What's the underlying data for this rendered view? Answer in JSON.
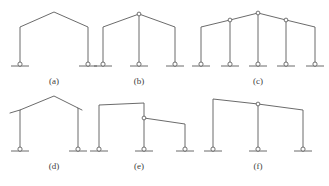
{
  "figure": {
    "background_color": "#ffffff",
    "line_color": "#5a5a5a",
    "caption_color": "#3d3d3d",
    "width": 329,
    "height": 186,
    "panels": [
      {
        "id": "a",
        "caption": "(a)",
        "caption_x": 54,
        "caption_y": 84,
        "description": "single-bay pitched portal frame, two pinned supports, no internal hinge",
        "column_count": 2,
        "hinge_count": 0,
        "support_count": 2,
        "members": "M20,66 L20,27 L54,12 L88,27 L88,66",
        "supports": [
          {
            "x": 20,
            "y": 66
          },
          {
            "x": 88,
            "y": 66
          }
        ],
        "hinges": []
      },
      {
        "id": "b",
        "caption": "(b)",
        "caption_x": 139,
        "caption_y": 84,
        "description": "single-bay pitched frame with central column and apex hinge",
        "column_count": 3,
        "hinge_count": 1,
        "support_count": 3,
        "members": "M103,66 L103,27 L139,14 L175,27 L175,66 M139,14 L139,66",
        "supports": [
          {
            "x": 103,
            "y": 66
          },
          {
            "x": 139,
            "y": 66
          },
          {
            "x": 175,
            "y": 66
          }
        ],
        "hinges": [
          {
            "x": 139,
            "y": 14
          }
        ]
      },
      {
        "id": "c",
        "caption": "(c)",
        "caption_x": 258,
        "caption_y": 84,
        "description": "multi-bay pitched frame, five columns, hinges at apex and two intermediate column heads",
        "column_count": 5,
        "hinge_count": 3,
        "support_count": 5,
        "members": "M201,66 L201,27 L230,20 L258,13 L286,20 L315,27 L315,66 M230,20 L230,66 M258,13 L258,66 M286,20 L286,66",
        "supports": [
          {
            "x": 201,
            "y": 66
          },
          {
            "x": 230,
            "y": 66
          },
          {
            "x": 258,
            "y": 66
          },
          {
            "x": 286,
            "y": 66
          },
          {
            "x": 315,
            "y": 66
          }
        ],
        "hinges": [
          {
            "x": 230,
            "y": 20
          },
          {
            "x": 258,
            "y": 13
          },
          {
            "x": 286,
            "y": 20
          }
        ]
      },
      {
        "id": "d",
        "caption": "(d)",
        "caption_x": 54,
        "caption_y": 169,
        "description": "pitched portal frame with cantilever roof overhangs beyond both columns",
        "column_count": 2,
        "hinge_count": 0,
        "support_count": 2,
        "members": "M20,151 L20,110 L54,96 L78,108 L78,151 M20,110 L10,113 M78,108 L82,110",
        "supports": [
          {
            "x": 20,
            "y": 151
          },
          {
            "x": 78,
            "y": 151
          }
        ],
        "hinges": []
      },
      {
        "id": "e",
        "caption": "(e)",
        "caption_x": 139,
        "caption_y": 169,
        "description": "stepped two-level frame with hinge at the step junction",
        "column_count": 3,
        "hinge_count": 1,
        "support_count": 3,
        "members": "M99,151 L99,105 L144,103 L144,151 M144,118 L185,124 L185,151",
        "supports": [
          {
            "x": 99,
            "y": 151
          },
          {
            "x": 144,
            "y": 151
          },
          {
            "x": 185,
            "y": 151
          }
        ],
        "hinges": [
          {
            "x": 144,
            "y": 118
          }
        ]
      },
      {
        "id": "f",
        "caption": "(f)",
        "caption_x": 258,
        "caption_y": 169,
        "description": "two-bay frame with shallow sloping roof and hinge above the central column",
        "column_count": 3,
        "hinge_count": 1,
        "support_count": 3,
        "members": "M213,151 L213,99 L258,104 L303,110 L303,151 M258,104 L258,151",
        "supports": [
          {
            "x": 213,
            "y": 151
          },
          {
            "x": 258,
            "y": 151
          },
          {
            "x": 303,
            "y": 151
          }
        ],
        "hinges": [
          {
            "x": 258,
            "y": 104
          }
        ]
      }
    ],
    "support_symbol": {
      "name": "pin-support",
      "ground_half_width": 9,
      "circle_radius": 2.1
    },
    "hinge_symbol": {
      "name": "internal-hinge",
      "circle_radius": 1.9
    }
  }
}
